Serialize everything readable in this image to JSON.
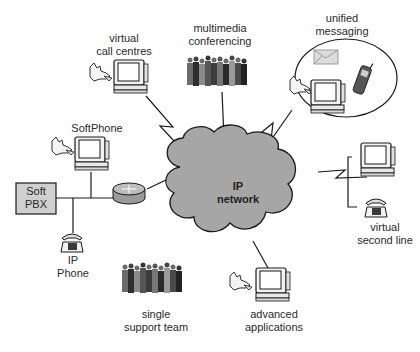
{
  "diagram": {
    "center": {
      "line1": "IP",
      "line2": "network"
    },
    "nodes": {
      "virtual_call_centres": {
        "line1": "virtual",
        "line2": "call centres"
      },
      "multimedia_conferencing": {
        "line1": "multimedia",
        "line2": "conferencing"
      },
      "unified_messaging": {
        "line1": "unified",
        "line2": "messaging"
      },
      "softphone": {
        "line1": "SoftPhone"
      },
      "soft_pbx": {
        "line1": "Soft",
        "line2": "PBX"
      },
      "ip_phone": {
        "line1": "IP",
        "line2": "Phone"
      },
      "virtual_second_line": {
        "line1": "virtual",
        "line2": "second line"
      },
      "single_support_team": {
        "line1": "single",
        "line2": "support team"
      },
      "advanced_applications": {
        "line1": "advanced",
        "line2": "applications"
      }
    },
    "colors": {
      "cloud_fill": "#a6a6a6",
      "stroke": "#1a1a1a",
      "pbx_fill": "#cfcfcf",
      "router_fill": "#9a9a9a"
    }
  }
}
